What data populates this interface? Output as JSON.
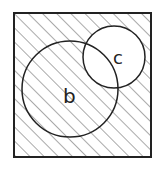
{
  "diagram": {
    "type": "venn",
    "universe": {
      "label": "",
      "x": 14,
      "y": 13,
      "width": 137,
      "height": 144
    },
    "sets": [
      {
        "id": "b",
        "label": "b",
        "cx": 70,
        "cy": 89,
        "r": 48,
        "label_x": 63,
        "label_y": 103
      },
      {
        "id": "c",
        "label": "c",
        "cx": 114,
        "cy": 57,
        "r": 31,
        "label_x": 121,
        "label_y": 63
      }
    ],
    "shaded_region": "c'",
    "shading": {
      "style": "diagonal-hatch",
      "angle_deg": 45,
      "spacing_px": 10
    },
    "colors": {
      "outline": "#222222",
      "hatch": "#555555",
      "background": "#ffffff"
    }
  }
}
